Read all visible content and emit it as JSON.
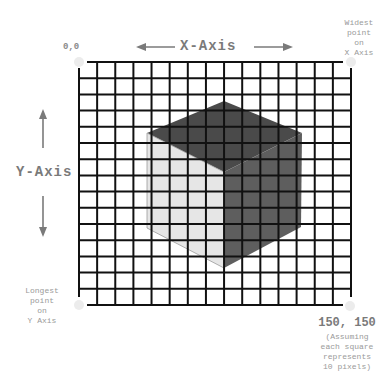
{
  "diagram": {
    "origin_label": "0,0",
    "x_axis_label": "X-Axis",
    "y_axis_label": "Y-Axis",
    "widest_point_lines": [
      "Widest",
      "point",
      "on",
      "X Axis"
    ],
    "longest_point_lines": [
      "Longest",
      "point",
      "on",
      "Y Axis"
    ],
    "end_coord_label": "150, 150",
    "assumption_lines": [
      "(Assuming",
      "each square",
      "represents",
      "10 pixels)"
    ],
    "grid": {
      "columns": 15,
      "rows": 15,
      "cell_value_px": 10
    },
    "cube": {
      "top_face_color": "#4a4a4a",
      "left_face_color": "#e6e6e6",
      "right_face_color": "#5e5e5e"
    },
    "colors": {
      "grid_line": "#111111",
      "arrow": "#7a7a7a",
      "text": "#8a8a8a",
      "corner_dot": "#e8e8e8"
    }
  }
}
